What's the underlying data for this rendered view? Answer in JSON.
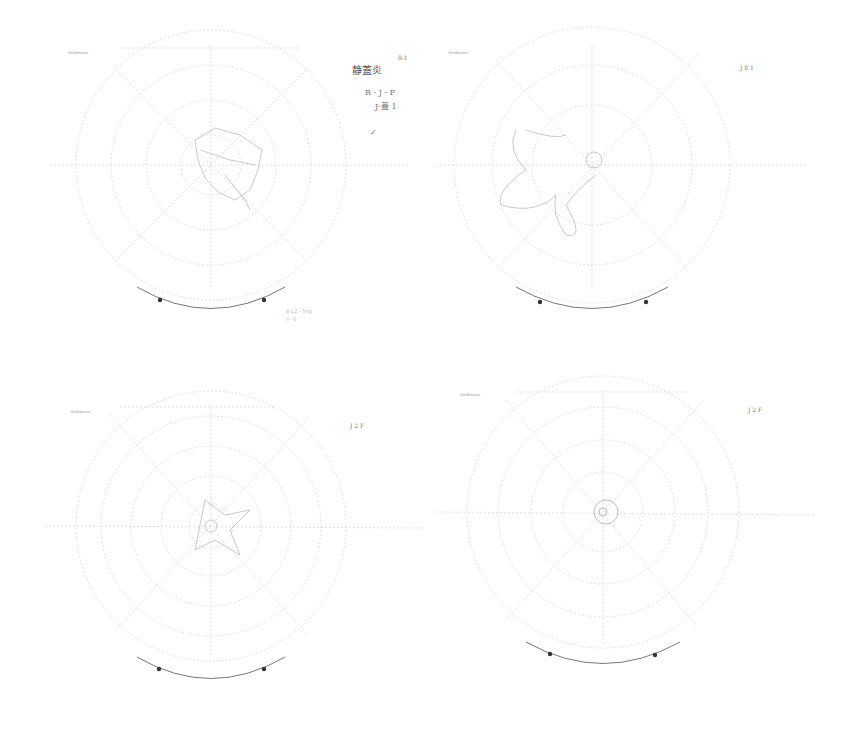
{
  "document": {
    "type": "scanned visual field perimetry charts (4 panels)",
    "panels": [
      {
        "id": "top-left",
        "header_label": "Goldmann",
        "annotations": [
          "静蓋炎",
          "R - J - F",
          "J-蓋 1",
          "✓"
        ],
        "footnote": [
          "ø 1.2 - 7mg",
          "n - 0"
        ],
        "corner_mark": "8-1"
      },
      {
        "id": "top-right",
        "header_label": "Goldmann",
        "annotations": [
          "J 8 1"
        ],
        "footnote": []
      },
      {
        "id": "bottom-left",
        "header_label": "Goldmann",
        "annotations": [
          "J 2 F"
        ],
        "footnote": []
      },
      {
        "id": "bottom-right",
        "header_label": "Goldmann",
        "annotations": [
          "J 2 F"
        ],
        "footnote": []
      }
    ],
    "colors": {
      "background": "#ffffff",
      "grid": "#c8c8c8",
      "trace": "#9a9a9a",
      "arc": "#6a6a6a",
      "dot": "#333333"
    }
  }
}
